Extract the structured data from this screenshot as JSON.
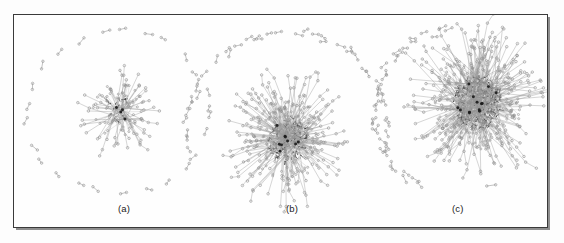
{
  "figure": {
    "kind": "network-graph-figure",
    "background_color": "#fdfdfd",
    "frame_color": "#3a3a3a",
    "node_color": "#8f8f8f",
    "edge_color": "#9a9a9a",
    "core_color": "#1a1a1a",
    "width": 564,
    "height": 243
  },
  "panels": [
    {
      "id": "a",
      "label": "(a)",
      "center_x": 118,
      "center_y": 110,
      "cluster": {
        "center_x": 118,
        "center_y": 110,
        "radius": 30,
        "density": "sparse",
        "hubs": 4,
        "spokes": 46,
        "core_darkness": 0.15,
        "description": "small sparse hub-and-spoke tree cluster"
      },
      "ring": {
        "center_x": 118,
        "center_y": 112,
        "radius_x": 92,
        "radius_y": 84,
        "arc_start_deg": 0,
        "arc_end_deg": 360,
        "dyad_count": 26,
        "description": "full circular ring of isolated dyad pairs"
      }
    },
    {
      "id": "b",
      "label": "(b)",
      "center_x": 288,
      "center_y": 110,
      "cluster": {
        "center_x": 288,
        "center_y": 140,
        "radius": 44,
        "density": "dense",
        "hubs": 9,
        "spokes": 120,
        "core_darkness": 0.55,
        "description": "dense giant component with radiating spokes"
      },
      "ring": {
        "center_x": 288,
        "center_y": 132,
        "radius_x": 103,
        "radius_y": 100,
        "arc_start_deg": 168,
        "arc_end_deg": 372,
        "dyad_count": 40,
        "description": "upper arc chain of dyad pairs"
      }
    },
    {
      "id": "c",
      "label": "(c)",
      "center_x": 455,
      "center_y": 110,
      "cluster": {
        "center_x": 478,
        "center_y": 102,
        "radius": 52,
        "density": "very-dense",
        "hubs": 13,
        "spokes": 170,
        "core_darkness": 0.8,
        "description": "largest densest cluster, offset right"
      },
      "ring": {
        "center_x": 462,
        "center_y": 112,
        "radius_x": 88,
        "radius_y": 84,
        "arc_start_deg": 118,
        "arc_end_deg": 262,
        "dyad_count": 30,
        "description": "left-side arc of dyad pairs"
      },
      "stray_dyads": [
        {
          "x": 492,
          "y": 186,
          "angle_deg": -8
        }
      ]
    }
  ],
  "chart_data": {
    "type": "scatter",
    "title": "",
    "xlabel": "",
    "ylabel": "",
    "series": [
      {
        "name": "(a)",
        "cluster_size": 50,
        "isolated_dyads": 26,
        "mean_degree": 1.6
      },
      {
        "name": "(b)",
        "cluster_size": 180,
        "isolated_dyads": 40,
        "mean_degree": 2.6
      },
      {
        "name": "(c)",
        "cluster_size": 290,
        "isolated_dyads": 30,
        "mean_degree": 3.4
      }
    ],
    "categories": [
      "(a)",
      "(b)",
      "(c)"
    ],
    "legend_position": "none",
    "grid": false
  }
}
